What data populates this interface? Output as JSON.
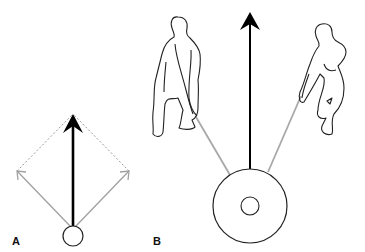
{
  "panels": [
    {
      "label": "A",
      "description": "Vector diagram: two gray diagonal force vectors forming a parallelogram (dotted) with a black resultant vector pointing up from a small circle"
    },
    {
      "label": "B",
      "description": "Two people pulling ropes attached to a weight plate; black resultant arrow points upward"
    }
  ],
  "colors": {
    "resultant": "#000000",
    "component": "#9a9a9a",
    "outline": "#222222",
    "background": "#ffffff"
  },
  "icons": [
    "resultant-arrow-icon",
    "component-arrow-icon",
    "weight-plate-icon",
    "person-silhouette-icon"
  ]
}
